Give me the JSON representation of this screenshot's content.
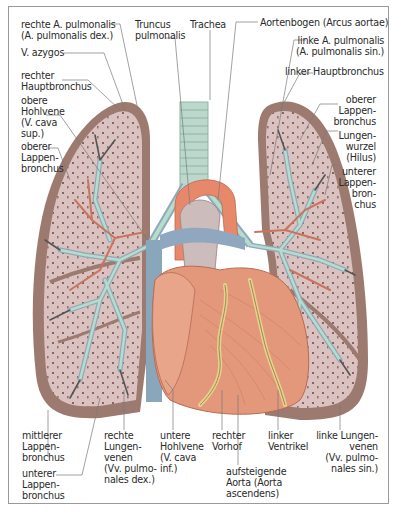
{
  "figure": {
    "colors": {
      "frame": "#9a9a9a",
      "pleura_outer": "#9c7a70",
      "lung_tissue": "#d8bfbc",
      "lung_dots": "#8a6060",
      "trachea": "#bcd8cc",
      "trachea_rings": "#8fb3a5",
      "bronchus_green": "#b6ddc8",
      "vein_blue": "#8fa8bf",
      "artery_red": "#c9745e",
      "heart": "#e3987c",
      "heart_shadow": "#c77a62",
      "coronary_fat": "#e6d28a",
      "aorta_arch": "#e8886a",
      "vena_cava": "#8aa6bb",
      "label_text": "#2a2a2a",
      "leader_line": "#7a7a7a"
    }
  },
  "labels": {
    "top": [
      {
        "id": "rechte-a-pulmonalis",
        "text": "rechte A. pulmonalis\n(A. pulmonalis dex.)"
      },
      {
        "id": "truncus-pulmonalis",
        "text": "Truncus\npulmonalis"
      },
      {
        "id": "trachea",
        "text": "Trachea"
      },
      {
        "id": "aortenbogen",
        "text": "Aortenbogen (Arcus aortae)"
      },
      {
        "id": "linke-a-pulmonalis",
        "text": "linke A. pulmonalis\n(A. pulmonalis sin.)"
      },
      {
        "id": "linker-hauptbronchus",
        "text": "linker Hauptbronchus"
      }
    ],
    "left": [
      {
        "id": "v-azygos",
        "text": "V. azygos"
      },
      {
        "id": "rechter-hauptbronchus",
        "text": "rechter\nHauptbronchus"
      },
      {
        "id": "obere-hohlvene",
        "text": "obere\nHohlvene\n(V. cava\nsup.)"
      },
      {
        "id": "oberer-lappenbronchus-rechts",
        "text": "oberer\nLappen-\nbronchus"
      }
    ],
    "right": [
      {
        "id": "oberer-lappenbronchus-links",
        "text": "oberer\nLappen-\nbronchus"
      },
      {
        "id": "lungenwurzel",
        "text": "Lungen-\nwurzel\n(Hilus)"
      },
      {
        "id": "unterer-lappenbronchus-links",
        "text": "unterer\nLappen-\nbron-\nchus"
      }
    ],
    "bottom": [
      {
        "id": "mittlerer-lappenbronchus",
        "text": "mittlerer\nLappen-\nbronchus"
      },
      {
        "id": "unterer-lappenbronchus-rechts",
        "text": "unterer\nLappen-\nbronchus"
      },
      {
        "id": "rechte-lungenvenen",
        "text": "rechte\nLungen-\nvenen\n(Vv. pulmo-\nnales dex.)"
      },
      {
        "id": "untere-hohlvene",
        "text": "untere\nHohlvene\n(V. cava\ninf.)"
      },
      {
        "id": "rechter-vorhof",
        "text": "rechter\nVorhof"
      },
      {
        "id": "aufsteigende-aorta",
        "text": "aufsteigende\nAorta (Aorta\nascendens)"
      },
      {
        "id": "linker-ventrikel",
        "text": "linker\nVentrikel"
      },
      {
        "id": "linke-lungenvenen",
        "text": "linke Lungen-\nvenen\n(Vv. pulmo-\nnales sin.)"
      }
    ]
  }
}
